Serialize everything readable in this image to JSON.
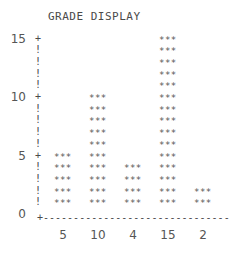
{
  "chart_data": {
    "type": "bar",
    "title": "GRADE DISPLAY",
    "categories": [
      "5",
      "10",
      "4",
      "15",
      "2"
    ],
    "values": [
      5,
      10,
      4,
      15,
      2
    ],
    "xlabel": "",
    "ylabel": "",
    "ylim": [
      0,
      15
    ],
    "yticks": [
      "15",
      "10",
      "5",
      "0"
    ],
    "bar_glyph": "***",
    "axis_tick_glyph": "+",
    "axis_line_glyph": "!",
    "grid": false,
    "legend": null
  }
}
